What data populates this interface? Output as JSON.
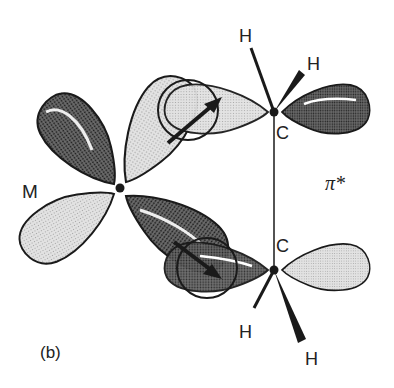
{
  "figure": {
    "panel_label": "(b)",
    "metal_label": "M",
    "carbon_top_label": "C",
    "carbon_bottom_label": "C",
    "orbital_label": "π*",
    "hydrogen_labels": [
      "H",
      "H",
      "H",
      "H"
    ]
  },
  "colors": {
    "outline": "#1a1a1a",
    "dark_lobe": "#555555",
    "light_lobe": "#d6d6d6",
    "background": "#ffffff"
  }
}
